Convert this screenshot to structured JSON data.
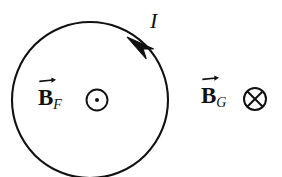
{
  "figure": {
    "background_color": "#ffffff",
    "stroke_color": "#111111",
    "width": 282,
    "height": 177
  },
  "loop": {
    "name": "current-loop",
    "center_x": 90,
    "center_y": 100,
    "radius": 78,
    "stroke_width": 2.1,
    "current_direction": "counterclockwise"
  },
  "current": {
    "label": "I",
    "arrow_tip_x": 127,
    "arrow_tip_y": 37,
    "arrow_tail_x": 150,
    "arrow_tail_y": 54
  },
  "fields": [
    {
      "id": "b-f",
      "base": "B",
      "subscript": "F",
      "symbol": "dot-in-circle",
      "symbol_meaning": "out-of-page",
      "symbol_x": 97,
      "symbol_y": 100,
      "symbol_radius": 10.5,
      "location": "inside-loop"
    },
    {
      "id": "b-g",
      "base": "B",
      "subscript": "G",
      "symbol": "cross-in-circle",
      "symbol_meaning": "into-page",
      "symbol_x": 255,
      "symbol_y": 99,
      "symbol_radius": 11,
      "location": "outside-loop"
    }
  ]
}
